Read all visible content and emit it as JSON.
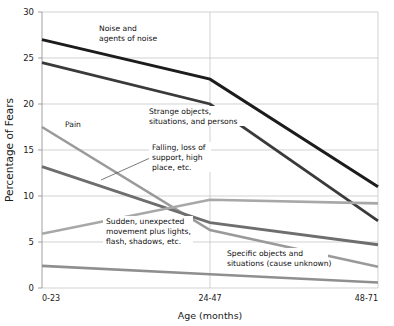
{
  "chart_data": {
    "type": "line",
    "title": "",
    "xlabel": "Age  (months)",
    "ylabel": "Percentage of Fears",
    "categories": [
      "0-23",
      "24-47",
      "48-71"
    ],
    "x": [
      0,
      1,
      2
    ],
    "ylim": [
      0,
      30
    ],
    "yticks": [
      0,
      5,
      10,
      15,
      20,
      25,
      30
    ],
    "ytick_labels": [
      "0",
      "5",
      "10",
      "15",
      "20",
      "25",
      "30"
    ],
    "grid": "horizontal-and-one-vertical",
    "legend": "inline-annotations",
    "series": [
      {
        "name": "Noise and agents of noise",
        "values": [
          27.0,
          22.7,
          11.0
        ],
        "color": "#1c1c1c",
        "width": 3.0
      },
      {
        "name": "Strange objects, situations, and persons",
        "values": [
          24.5,
          20.0,
          7.3
        ],
        "color": "#3a3a3a",
        "width": 2.8
      },
      {
        "name": "Pain",
        "values": [
          17.5,
          6.3,
          2.3
        ],
        "color": "#9a9a9a",
        "width": 2.6
      },
      {
        "name": "Falling, loss of support, high place, etc.",
        "values": [
          13.2,
          7.1,
          4.7
        ],
        "color": "#6e6e6e",
        "width": 2.8
      },
      {
        "name": "Sudden, unexpected movement plus lights, flash, shadows, etc.",
        "values": [
          5.9,
          9.6,
          9.2
        ],
        "color": "#a8a8a8",
        "width": 2.6
      },
      {
        "name": "Specific objects and situations (cause unknown)",
        "values": [
          2.4,
          1.5,
          0.6
        ],
        "color": "#8f8f8f",
        "width": 2.6
      }
    ],
    "annotations": [
      {
        "id": "noise",
        "lines": [
          "Noise and",
          "agents of noise"
        ],
        "x": 99,
        "y": 31
      },
      {
        "id": "strange",
        "lines": [
          "Strange objects,",
          "situations, and persons"
        ],
        "x": 149,
        "y": 114
      },
      {
        "id": "pain",
        "lines": [
          "Pain"
        ],
        "x": 65,
        "y": 127
      },
      {
        "id": "falling",
        "lines": [
          "Falling, loss of",
          "support, high",
          "place, etc."
        ],
        "x": 152,
        "y": 150
      },
      {
        "id": "sudden",
        "lines": [
          "Sudden, unexpected",
          "movement plus lights,",
          "flash, shadows, etc."
        ],
        "x": 106,
        "y": 224
      },
      {
        "id": "specific",
        "lines": [
          "Specific objects and",
          "situations (cause unknown)"
        ],
        "x": 227,
        "y": 256
      }
    ],
    "colors": {
      "grid": "#bfbfbf",
      "axis": "#8a8a8a",
      "text": "#1a1a1a",
      "background": "#ffffff"
    }
  },
  "top_cut_text": ""
}
